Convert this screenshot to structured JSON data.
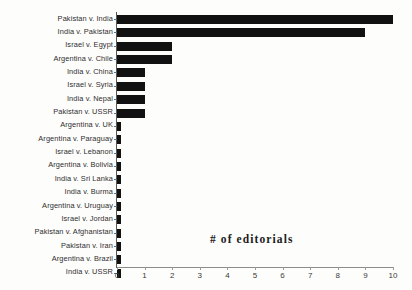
{
  "chart_data": {
    "type": "bar",
    "orientation": "horizontal",
    "title": "",
    "xlabel": "# of editorials",
    "ylabel": "",
    "xlim": [
      0,
      10
    ],
    "xticks": [
      "0",
      "1",
      "2",
      "3",
      "4",
      "5",
      "6",
      "7",
      "8",
      "9",
      "10"
    ],
    "grid": false,
    "legend": null,
    "bar_color": "#111111",
    "categories": [
      "Pakistan v. India",
      "India v. Pakistan",
      "Israel v. Egypt",
      "Argentina v. Chile",
      "India v. China",
      "Israel v. Syria",
      "India v. Nepal",
      "Pakistan v. USSR",
      "Argentina v. UK",
      "Argentina v. Paraguay",
      "Israel v. Lebanon",
      "Argentina v. Bolivia",
      "India v. Sri Lanka",
      "India v. Burma",
      "Argentina v. Uruguay",
      "Israel v. Jordan",
      "Pakistan v. Afghanistan",
      "Pakistan v. Iran",
      "Argentina v. Brazil",
      "India v. USSR"
    ],
    "values": [
      10,
      9,
      2,
      2,
      1,
      1,
      1,
      1,
      0,
      0,
      0,
      0,
      0,
      0,
      0,
      0,
      0,
      0,
      0,
      0
    ]
  }
}
